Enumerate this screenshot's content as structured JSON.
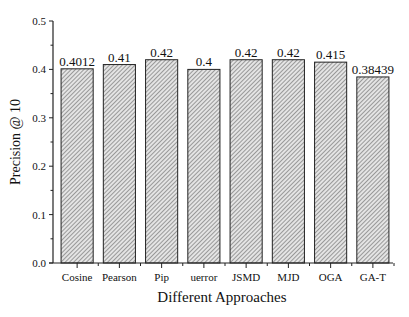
{
  "chart_data": {
    "type": "bar",
    "title": "",
    "xlabel": "Different Approaches",
    "ylabel": "Precision @ 10",
    "categories": [
      "Cosine",
      "Pearson",
      "Pip",
      "uerror",
      "JSMD",
      "MJD",
      "OGA",
      "GA-T"
    ],
    "values": [
      0.4012,
      0.41,
      0.42,
      0.4,
      0.42,
      0.42,
      0.415,
      0.38439
    ],
    "value_labels": [
      "0.4012",
      "0.41",
      "0.42",
      "0.4",
      "0.42",
      "0.42",
      "0.415",
      "0.38439"
    ],
    "ylim": [
      0.0,
      0.5
    ],
    "yticks": [
      "0.0",
      "0.1",
      "0.2",
      "0.3",
      "0.4",
      "0.5"
    ],
    "grid": false,
    "legend": null,
    "bar_fill": "hatched diagonal gray",
    "colors": {
      "bar_edge": "#222222",
      "hatch": "#555555",
      "bar_bg": "#e6e6e6"
    }
  }
}
